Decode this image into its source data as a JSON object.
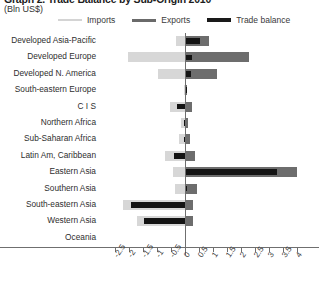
{
  "header": {
    "title": "Graph 2. Trade Balance by Sub-Origin 2010",
    "subtitle": "(Bln US$)"
  },
  "legend": {
    "position": "top",
    "items": [
      {
        "label": "Imports",
        "color": "#d7d7d7",
        "icon": "line-swatch-icon"
      },
      {
        "label": "Exports",
        "color": "#6d6d6d",
        "icon": "line-swatch-icon"
      },
      {
        "label": "Trade balance",
        "color": "#141414",
        "icon": "line-swatch-icon"
      }
    ]
  },
  "chart_data": {
    "type": "bar",
    "orientation": "horizontal",
    "title": "Graph 2. Trade Balance by Sub-Origin 2010",
    "subtitle": "(Bln US$)",
    "xlabel": "",
    "ylabel": "",
    "xlim": [
      -2.5,
      4
    ],
    "xticks": [
      -2.5,
      -2,
      -1.5,
      -1,
      -0.5,
      0,
      0.5,
      1,
      1.5,
      2,
      2.5,
      3,
      3.5,
      4
    ],
    "xticklabels": [
      "-2.5",
      "-2",
      "-1.5",
      "-1",
      "-0.5",
      "0",
      "0.5",
      "1",
      "1.5",
      "2",
      "2.5",
      "3",
      "3.5",
      "4"
    ],
    "grid": false,
    "legend_position": "top",
    "categories": [
      "Developed Asia-Pacific",
      "Developed Europe",
      "Developed N. America",
      "South-eastern Europe",
      "C I S",
      "Northern Africa",
      "Sub-Saharan Africa",
      "Latin Am, Caribbean",
      "Eastern Asia",
      "Southern Asia",
      "South-eastern Asia",
      "Western Asia",
      "Oceania"
    ],
    "series": [
      {
        "name": "Imports",
        "color": "#d7d7d7",
        "values": [
          -0.33,
          -2.03,
          -0.95,
          -0.04,
          -0.52,
          -0.14,
          -0.22,
          -0.73,
          -0.42,
          -0.36,
          -2.23,
          -1.73,
          0.0
        ]
      },
      {
        "name": "Exports",
        "color": "#6d6d6d",
        "values": [
          0.85,
          2.28,
          1.15,
          0.05,
          0.25,
          0.12,
          0.18,
          0.35,
          4.0,
          0.42,
          0.3,
          0.28,
          0.0
        ]
      },
      {
        "name": "Trade balance",
        "color": "#141414",
        "values": [
          0.52,
          0.25,
          0.2,
          0.01,
          -0.27,
          -0.02,
          -0.04,
          -0.38,
          3.3,
          0.06,
          -1.93,
          -1.45,
          0.0
        ]
      }
    ]
  }
}
